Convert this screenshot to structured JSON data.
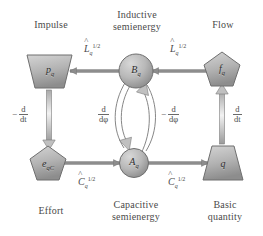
{
  "figure": {
    "type": "diagram",
    "title": "",
    "background": "#ffffff",
    "node_fill_light": "#cfcfcf",
    "node_fill_dark": "#8f8f8f",
    "node_stroke": "#6b6b6b",
    "arrow_color": "#8a8a8a",
    "text_color": "#4a4a4a"
  },
  "corner_labels": {
    "top_left": "Impulse",
    "top_center_line1": "Inductive",
    "top_center_line2": "semienergy",
    "top_right": "Flow",
    "bottom_left": "Effort",
    "bottom_center_line1": "Capacitive",
    "bottom_center_line2": "semienergy",
    "bottom_right_line1": "Basic",
    "bottom_right_line2": "quantity"
  },
  "nodes": {
    "impulse": {
      "shape": "trapezoid-down",
      "base": "p",
      "sub": "q"
    },
    "inductive": {
      "shape": "circle",
      "base": "B",
      "sub": "q"
    },
    "flow": {
      "shape": "pentagon",
      "base": "f",
      "sub": "q"
    },
    "effort": {
      "shape": "pentagon",
      "base": "e",
      "sub": "qC"
    },
    "capacitive": {
      "shape": "circle",
      "base": "A",
      "sub": "q"
    },
    "quantity": {
      "shape": "trapezoid-up",
      "base": "q",
      "sub": ""
    }
  },
  "edge_labels": {
    "L_top_left": {
      "hat": "˄",
      "base": "L",
      "sub": "q",
      "sup": "1/2"
    },
    "L_top_right": {
      "hat": "˄",
      "base": "L",
      "sub": "q",
      "sup": "1/2"
    },
    "C_bottom_left": {
      "hat": "˄",
      "base": "C",
      "sub": "q",
      "sup": "1/2"
    },
    "C_bottom_right": {
      "hat": "˄",
      "base": "C",
      "sub": "q",
      "sup": "1/2"
    },
    "left_deriv": {
      "sign": "−",
      "num": "d",
      "den": "dt"
    },
    "right_deriv": {
      "sign": "",
      "num": "d",
      "den": "dt"
    },
    "center_left_deriv": {
      "sign": "",
      "num": "d",
      "den": "dφ"
    },
    "center_right_deriv": {
      "sign": "−",
      "num": "d",
      "den": "dφ"
    }
  }
}
